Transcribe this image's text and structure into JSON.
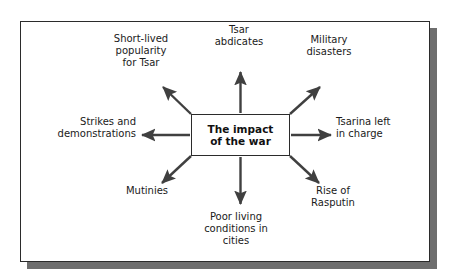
{
  "diagram": {
    "title": "The impact of the war",
    "type": "mind-map",
    "center": {
      "label": "The impact\nof the war"
    },
    "nodes": [
      {
        "id": "tsar-abdicates",
        "label": "Tsar\nabdicates",
        "direction": "up",
        "align": "center"
      },
      {
        "id": "short-lived-popularity",
        "label": "Short-lived\npopularity\nfor Tsar",
        "direction": "up-left",
        "align": "center"
      },
      {
        "id": "military-disasters",
        "label": "Military\ndisasters",
        "direction": "up-right",
        "align": "center"
      },
      {
        "id": "strikes-and-demonstrations",
        "label": "Strikes and\ndemonstrations",
        "direction": "left",
        "align": "right"
      },
      {
        "id": "tsarina-left-in-charge",
        "label": "Tsarina left\nin charge",
        "direction": "right",
        "align": "left"
      },
      {
        "id": "mutinies",
        "label": "Mutinies",
        "direction": "down-left",
        "align": "center"
      },
      {
        "id": "poor-living-conditions",
        "label": "Poor living\nconditions in\ncities",
        "direction": "down",
        "align": "center"
      },
      {
        "id": "rise-of-rasputin",
        "label": "Rise of\nRasputin",
        "direction": "down-right",
        "align": "center"
      }
    ],
    "colors": {
      "line": "#404040",
      "frame_border": "#2b2b2b",
      "shadow": "#6e6e6e",
      "text": "#1a1a1a",
      "background": "#ffffff"
    }
  }
}
